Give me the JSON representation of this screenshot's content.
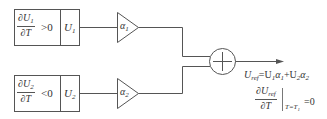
{
  "diagram": {
    "blocks": [
      {
        "id": "block-1",
        "condition_num": "∂U",
        "condition_num_sub": "1",
        "condition_den": "∂T",
        "condition_rel": ">0",
        "output_label": "U",
        "output_sub": "1"
      },
      {
        "id": "block-2",
        "condition_num": "∂U",
        "condition_num_sub": "2",
        "condition_den": "∂T",
        "condition_rel": "<0",
        "output_label": "U",
        "output_sub": "2"
      }
    ],
    "gains": [
      {
        "label": "α",
        "sub": "1"
      },
      {
        "label": "α",
        "sub": "2"
      }
    ],
    "summing_junction": {
      "symbol": "+"
    },
    "output": {
      "equation_lhs": "U",
      "equation_lhs_sub": "ref",
      "equation_rhs_a": "=U",
      "equation_rhs_a_sub": "1",
      "equation_rhs_b": "α",
      "equation_rhs_b_sub": "1",
      "equation_rhs_c": "+U",
      "equation_rhs_c_sub": "2",
      "equation_rhs_d": "α",
      "equation_rhs_d_sub": "2",
      "deriv_num": "∂U",
      "deriv_num_sub": "ref",
      "deriv_den": "∂T",
      "eval_at": "T=T",
      "eval_at_sub": "1",
      "eval_value": "=0"
    },
    "colors": {
      "stroke": "#555555",
      "text": "#333333",
      "background": "#ffffff"
    }
  }
}
